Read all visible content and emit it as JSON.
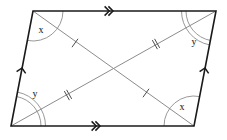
{
  "figure": {
    "type": "parallelogram-with-diagonals",
    "width": 227,
    "height": 140,
    "background_color": "#ffffff",
    "edge_color": "#1a1a1a",
    "diagonal_color": "#8c8c8c",
    "arc_color": "#8c8c8c",
    "tick_color": "#4d4d4d",
    "label_color": "#111111",
    "vertices": {
      "top_left": {
        "x": 33,
        "y": 11
      },
      "top_right": {
        "x": 216,
        "y": 11
      },
      "bottom_right": {
        "x": 194,
        "y": 126
      },
      "bottom_left": {
        "x": 11,
        "y": 126
      }
    },
    "diagonal_intersection": {
      "x": 113.5,
      "y": 68.5
    }
  },
  "angle_labels": [
    {
      "id": "angle-x-top-left",
      "text": "x",
      "x": 41,
      "y": 31,
      "arcs": 1,
      "vertex": "top_left"
    },
    {
      "id": "angle-y-top-right",
      "text": "y",
      "x": 194,
      "y": 43,
      "arcs": 2,
      "vertex": "top_right"
    },
    {
      "id": "angle-y-bottom-left",
      "text": "y",
      "x": 35,
      "y": 95,
      "arcs": 2,
      "vertex": "bottom_left"
    },
    {
      "id": "angle-x-bottom-right",
      "text": "x",
      "x": 182,
      "y": 108,
      "arcs": 1,
      "vertex": "bottom_right"
    }
  ],
  "tick_marks": [
    {
      "id": "tick-upper-left-diagonal",
      "count": 1,
      "x": 75,
      "y": 43,
      "segment": "top_left-to-bottom_right"
    },
    {
      "id": "tick-upper-right-diagonal",
      "count": 2,
      "x": 156,
      "y": 44,
      "segment": "bottom_left-to-top_right"
    },
    {
      "id": "tick-lower-left-diagonal",
      "count": 2,
      "x": 68,
      "y": 95,
      "segment": "bottom_left-to-top_right"
    },
    {
      "id": "tick-lower-right-diagonal",
      "count": 1,
      "x": 146,
      "y": 93,
      "segment": "top_left-to-bottom_right"
    }
  ],
  "side_arrows": [
    {
      "id": "arrow-top-edge",
      "chevrons": 2,
      "x": 113,
      "y": 11,
      "direction": "right",
      "edge": "top"
    },
    {
      "id": "arrow-bottom-edge",
      "chevrons": 2,
      "x": 100,
      "y": 126,
      "direction": "right",
      "edge": "bottom"
    },
    {
      "id": "arrow-left-edge",
      "chevrons": 1,
      "x": 22,
      "y": 68,
      "direction": "up",
      "edge": "left"
    },
    {
      "id": "arrow-right-edge",
      "chevrons": 1,
      "x": 205,
      "y": 68,
      "direction": "up",
      "edge": "right"
    }
  ]
}
